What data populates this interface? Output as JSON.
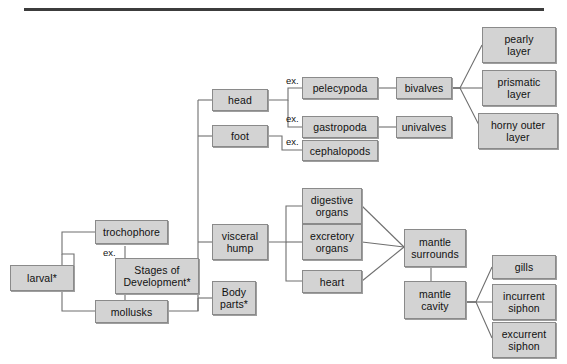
{
  "figure": {
    "top_rule": true,
    "clipped_header_text": "",
    "clipped_footer_text": ""
  },
  "colors": {
    "node_fill": "#d3d3d3",
    "node_border": "#8a8a8a",
    "connector": "#6f6f6f",
    "rule": "#3c3c3c",
    "text": "#111111"
  },
  "nodes": {
    "larval": "larval*",
    "trochophore": "trochophore",
    "stages_of_development": "Stages of\nDevelopment*",
    "mollusks": "mollusks",
    "head": "head",
    "foot": "foot",
    "visceral_hump": "visceral\nhump",
    "body_parts": "Body\nparts*",
    "pelecypoda": "pelecypoda",
    "gastropoda": "gastropoda",
    "cephalopods": "cephalopods",
    "bivalves": "bivalves",
    "univalves": "univalves",
    "pearly_layer": "pearly\nlayer",
    "prismatic_layer": "prismatic\nlayer",
    "horny_outer_layer": "horny outer\nlayer",
    "digestive_organs": "digestive\norgans",
    "excretory_organs": "excretory\norgans",
    "heart": "heart",
    "mantle_surrounds": "mantle\nsurrounds",
    "mantle_cavity": "mantle\ncavity",
    "gills": "gills",
    "incurrent_siphon": "incurrent\nsiphon",
    "excurrent_siphon": "excurrent\nsiphon"
  },
  "edge_labels": {
    "ex_trochophore": "ex.",
    "ex_pelecypoda": "ex.",
    "ex_gastropoda": "ex.",
    "ex_cephalopods": "ex."
  }
}
